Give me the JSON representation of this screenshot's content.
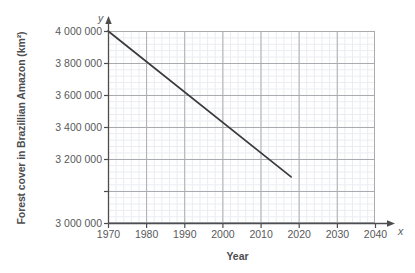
{
  "chart_data": {
    "type": "line",
    "title": "",
    "xlabel": "Year",
    "ylabel": "Forest cover in Brazillian Amazon (km²)",
    "x_axis_letter": "y",
    "y_axis_letter": "x",
    "xlim": [
      1970,
      2040
    ],
    "ylim": [
      3000000,
      4000000
    ],
    "x_tick_labels": [
      "1970",
      "1980",
      "1990",
      "2000",
      "2010",
      "2020",
      "2030",
      "2040"
    ],
    "x_ticks": [
      1970,
      1980,
      1990,
      2000,
      2010,
      2020,
      2030,
      2040
    ],
    "y_tick_labels": [
      "3 000 000",
      "3 200 000",
      "3 400 000",
      "3 600 000",
      "3 800 000",
      "4 000 000"
    ],
    "y_ticks": [
      3000000,
      3200000,
      3400000,
      3600000,
      3800000,
      4000000
    ],
    "grid": "major and minor",
    "minor_divisions_per_major": 5,
    "legend": "none",
    "series": [
      {
        "name": "Forest cover",
        "x": [
          1970,
          2018
        ],
        "values": [
          4000000,
          3240000
        ],
        "color": "#3a3a3c"
      }
    ]
  },
  "axes": {
    "x_letter": "x",
    "y_letter": "y",
    "x_title": "Year",
    "y_title": "Forest cover in Brazillian Amazon (km²)"
  },
  "colors": {
    "line": "#3a3a3c",
    "major_grid": "#a9abae",
    "minor_grid": "#d9dde6",
    "axis": "#4d4d4f",
    "text": "#58595b"
  }
}
